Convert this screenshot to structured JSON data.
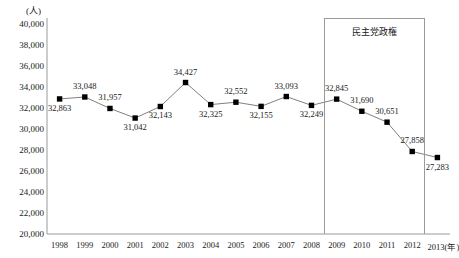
{
  "chart_data": {
    "type": "line",
    "title": "",
    "xlabel": "(年)",
    "ylabel": "(人)",
    "unit_label": "(人)",
    "x_axis_suffix": "(年)",
    "categories": [
      "1998",
      "1999",
      "2000",
      "2001",
      "2002",
      "2003",
      "2004",
      "2005",
      "2006",
      "2007",
      "2008",
      "2009",
      "2010",
      "2011",
      "2012",
      "2013"
    ],
    "values": [
      32863,
      33048,
      31957,
      31042,
      32143,
      34427,
      32325,
      32552,
      32155,
      33093,
      32249,
      32845,
      31690,
      30651,
      27858,
      27283
    ],
    "value_labels": [
      "32,863",
      "33,048",
      "31,957",
      "31,042",
      "32,143",
      "34,427",
      "32,325",
      "32,552",
      "32,155",
      "33,093",
      "32,249",
      "32,845",
      "31,690",
      "30,651",
      "27,858",
      "27,283"
    ],
    "label_positions": [
      "below",
      "above",
      "above",
      "below",
      "below",
      "above",
      "below",
      "above",
      "below",
      "above",
      "below",
      "above",
      "above",
      "above",
      "above",
      "below"
    ],
    "ylim": [
      20000,
      40000
    ],
    "yticks": [
      40000,
      38000,
      36000,
      34000,
      32000,
      30000,
      28000,
      26000,
      24000,
      22000,
      20000
    ],
    "ytick_labels": [
      "40,000",
      "38,000",
      "36,000",
      "34,000",
      "32,000",
      "30,000",
      "28,000",
      "26,000",
      "24,000",
      "22,000",
      "20,000"
    ],
    "grid": false,
    "legend": null,
    "marker": "square",
    "marker_color": "#000000",
    "line_color": "#808080",
    "axis_color": "#9a9a9a",
    "annotations": [
      {
        "text": "民主党政権",
        "type": "span-box",
        "start_category": "2009",
        "end_category": "2012",
        "name": "democratic-party-government-annotation"
      }
    ]
  }
}
